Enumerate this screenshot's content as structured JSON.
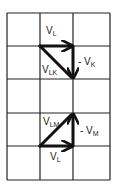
{
  "grid": {
    "columns": 3,
    "rows": 5,
    "line_color": "#222222"
  },
  "upper_diagram": {
    "vectors": [
      {
        "name": "V_L",
        "main": "V",
        "sub": "L",
        "prefix": "",
        "from": [
          1,
          1
        ],
        "to": [
          2,
          1
        ]
      },
      {
        "name": "-V_K",
        "main": "V",
        "sub": "K",
        "prefix": "- ",
        "from": [
          2,
          1
        ],
        "to": [
          2,
          2
        ]
      },
      {
        "name": "V_LK",
        "main": "V",
        "sub": "LK",
        "prefix": "",
        "from": [
          1,
          1
        ],
        "to": [
          2,
          2
        ]
      }
    ]
  },
  "lower_diagram": {
    "vectors": [
      {
        "name": "V_L",
        "main": "V",
        "sub": "L",
        "prefix": "",
        "from": [
          1,
          4
        ],
        "to": [
          2,
          4
        ]
      },
      {
        "name": "-V_M",
        "main": "V",
        "sub": "M",
        "prefix": "- ",
        "from": [
          2,
          4
        ],
        "to": [
          2,
          3
        ]
      },
      {
        "name": "V_LM",
        "main": "V",
        "sub": "LM",
        "prefix": "",
        "from": [
          1,
          4
        ],
        "to": [
          2,
          3
        ]
      }
    ]
  },
  "labels": {
    "upper_vl_main": "V",
    "upper_vl_sub": "L",
    "upper_vk_prefix": "- V",
    "upper_vk_sub": "K",
    "upper_vlk_main": "V",
    "upper_vlk_sub": "LK",
    "lower_vlm_main": "V",
    "lower_vlm_sub": "LM",
    "lower_vm_prefix": "- V",
    "lower_vm_sub": "M",
    "lower_vl_main": "V",
    "lower_vl_sub": "L"
  }
}
